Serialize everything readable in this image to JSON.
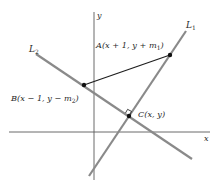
{
  "diagram": {
    "type": "coordinate-geometry",
    "colors": {
      "axis": "#5a5a5a",
      "line": "#8a8a8a",
      "segment": "#1e1e1e",
      "point": "#111111",
      "text": "#2a2a2a",
      "background": "#ffffff"
    },
    "axes": {
      "x_label": "x",
      "y_label": "y"
    },
    "lines": [
      {
        "id": "L1",
        "label": "L",
        "subscript": "1"
      },
      {
        "id": "L2",
        "label": "L",
        "subscript": "2"
      }
    ],
    "points": {
      "A": {
        "name": "A",
        "coords_text": "(x + 1, y + m",
        "subscript": "1",
        "close": ")"
      },
      "B": {
        "name": "B",
        "coords_text": "(x − 1, y − m",
        "subscript": "2",
        "close": ")"
      },
      "C": {
        "name": "C",
        "coords_text": "(x, y)"
      }
    },
    "annotations": {
      "right_angle_at": "C",
      "segment": "AB"
    }
  }
}
